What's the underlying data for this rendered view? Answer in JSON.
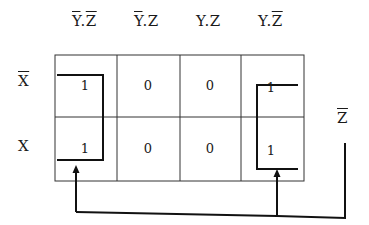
{
  "columns": [
    {
      "parts": [
        {
          "t": "Y",
          "bar": true
        },
        {
          "t": ".",
          "bar": false
        },
        {
          "t": "Z",
          "bar": true
        }
      ]
    },
    {
      "parts": [
        {
          "t": "Y",
          "bar": true
        },
        {
          "t": ".",
          "bar": false
        },
        {
          "t": "Z",
          "bar": false
        }
      ]
    },
    {
      "parts": [
        {
          "t": "Y",
          "bar": false
        },
        {
          "t": ".",
          "bar": false
        },
        {
          "t": "Z",
          "bar": false
        }
      ]
    },
    {
      "parts": [
        {
          "t": "Y",
          "bar": false
        },
        {
          "t": ".",
          "bar": false
        },
        {
          "t": "Z",
          "bar": true
        }
      ]
    }
  ],
  "rows": [
    {
      "label": "X",
      "bar": true,
      "values": [
        "1",
        "0",
        "0",
        "1"
      ]
    },
    {
      "label": "X",
      "bar": false,
      "values": [
        "1",
        "0",
        "0",
        "1"
      ]
    }
  ],
  "result_label": {
    "text": "Z",
    "bar": true
  }
}
